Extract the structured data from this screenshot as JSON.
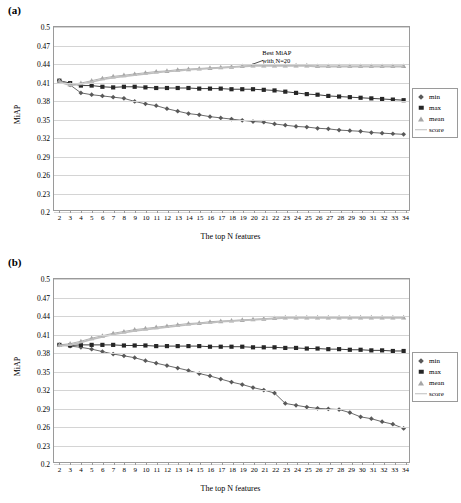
{
  "figure": {
    "panels": [
      {
        "label": "(a)"
      },
      {
        "label": "(b)"
      }
    ]
  },
  "legend": {
    "items": [
      {
        "key": "min",
        "label": "min",
        "marker": "diamond-icon",
        "color": "#595959"
      },
      {
        "key": "max",
        "label": "max",
        "marker": "square-icon",
        "color": "#262626"
      },
      {
        "key": "mean",
        "label": "mean",
        "marker": "triangle-icon",
        "color": "#a6a6a6"
      },
      {
        "key": "score",
        "label": "score",
        "marker": "line-icon",
        "color": "#bfbfbf"
      }
    ]
  },
  "annotation_a": {
    "line1": "Best MiAP",
    "line2": "with N=20"
  },
  "chart_data": [
    {
      "type": "line",
      "id": "panel-a",
      "title": "(a)",
      "xlabel": "The top N features",
      "ylabel": "MiAP",
      "xlim": [
        2,
        34
      ],
      "ylim": [
        0.2,
        0.5
      ],
      "yticks": [
        0.2,
        0.23,
        0.26,
        0.29,
        0.32,
        0.35,
        0.38,
        0.41,
        0.44,
        0.47,
        0.5
      ],
      "ytick_labels": [
        "0.2",
        "0.23",
        "0.26",
        "0.29",
        "0.32",
        "0.35",
        "0.38",
        "0.41",
        "0.44",
        "0.47",
        "0.5"
      ],
      "grid": true,
      "legend_position": "right",
      "categories": [
        2,
        3,
        4,
        5,
        6,
        7,
        8,
        9,
        10,
        11,
        12,
        13,
        14,
        15,
        16,
        17,
        18,
        19,
        20,
        21,
        22,
        23,
        24,
        25,
        26,
        27,
        28,
        29,
        30,
        31,
        32,
        33,
        34
      ],
      "annotations": [
        {
          "text": "Best MiAP with N=20",
          "x": 20,
          "y": 0.44
        }
      ],
      "series": [
        {
          "name": "min",
          "marker": "diamond",
          "color": "#595959",
          "values": [
            0.412,
            0.405,
            0.392,
            0.389,
            0.387,
            0.385,
            0.383,
            0.378,
            0.374,
            0.371,
            0.366,
            0.362,
            0.358,
            0.356,
            0.353,
            0.351,
            0.349,
            0.347,
            0.345,
            0.344,
            0.341,
            0.339,
            0.337,
            0.336,
            0.334,
            0.333,
            0.331,
            0.33,
            0.329,
            0.327,
            0.326,
            0.325,
            0.324
          ]
        },
        {
          "name": "max",
          "marker": "square",
          "color": "#262626",
          "values": [
            0.412,
            0.408,
            0.404,
            0.404,
            0.402,
            0.401,
            0.402,
            0.402,
            0.401,
            0.4,
            0.4,
            0.4,
            0.4,
            0.399,
            0.399,
            0.399,
            0.398,
            0.398,
            0.398,
            0.397,
            0.396,
            0.394,
            0.392,
            0.39,
            0.389,
            0.387,
            0.386,
            0.385,
            0.384,
            0.383,
            0.382,
            0.381,
            0.38
          ]
        },
        {
          "name": "mean",
          "marker": "triangle",
          "color": "#a6a6a6",
          "values": [
            0.412,
            0.406,
            0.408,
            0.412,
            0.416,
            0.419,
            0.421,
            0.423,
            0.425,
            0.427,
            0.428,
            0.43,
            0.431,
            0.432,
            0.433,
            0.434,
            0.435,
            0.436,
            0.437,
            0.437,
            0.437,
            0.437,
            0.437,
            0.437,
            0.436,
            0.436,
            0.436,
            0.436,
            0.436,
            0.436,
            0.436,
            0.436,
            0.436
          ]
        },
        {
          "name": "score",
          "marker": "line",
          "color": "#bfbfbf",
          "values": [
            0.41,
            0.404,
            0.406,
            0.41,
            0.414,
            0.417,
            0.419,
            0.421,
            0.423,
            0.425,
            0.427,
            0.428,
            0.43,
            0.431,
            0.432,
            0.433,
            0.434,
            0.435,
            0.436,
            0.436,
            0.436,
            0.436,
            0.436,
            0.436,
            0.435,
            0.435,
            0.435,
            0.435,
            0.435,
            0.435,
            0.435,
            0.435,
            0.435
          ]
        }
      ]
    },
    {
      "type": "line",
      "id": "panel-b",
      "title": "(b)",
      "xlabel": "The top N features",
      "ylabel": "MiAP",
      "xlim": [
        2,
        34
      ],
      "ylim": [
        0.2,
        0.5
      ],
      "yticks": [
        0.2,
        0.23,
        0.26,
        0.29,
        0.32,
        0.35,
        0.38,
        0.41,
        0.44,
        0.47,
        0.5
      ],
      "ytick_labels": [
        "0.2",
        "0.23",
        "0.26",
        "0.29",
        "0.32",
        "0.35",
        "0.38",
        "0.41",
        "0.44",
        "0.47",
        "0.5"
      ],
      "grid": true,
      "legend_position": "right",
      "categories": [
        2,
        3,
        4,
        5,
        6,
        7,
        8,
        9,
        10,
        11,
        12,
        13,
        14,
        15,
        16,
        17,
        18,
        19,
        20,
        21,
        22,
        23,
        24,
        25,
        26,
        27,
        28,
        29,
        30,
        31,
        32,
        33,
        34
      ],
      "series": [
        {
          "name": "min",
          "marker": "diamond",
          "color": "#595959",
          "values": [
            0.392,
            0.39,
            0.388,
            0.385,
            0.381,
            0.377,
            0.374,
            0.371,
            0.366,
            0.362,
            0.358,
            0.354,
            0.35,
            0.345,
            0.341,
            0.336,
            0.331,
            0.327,
            0.322,
            0.318,
            0.313,
            0.296,
            0.293,
            0.29,
            0.288,
            0.287,
            0.286,
            0.281,
            0.274,
            0.271,
            0.266,
            0.262,
            0.255
          ]
        },
        {
          "name": "max",
          "marker": "square",
          "color": "#262626",
          "values": [
            0.392,
            0.391,
            0.392,
            0.392,
            0.392,
            0.392,
            0.391,
            0.391,
            0.391,
            0.39,
            0.39,
            0.39,
            0.39,
            0.39,
            0.389,
            0.389,
            0.389,
            0.389,
            0.388,
            0.388,
            0.388,
            0.387,
            0.387,
            0.386,
            0.386,
            0.385,
            0.385,
            0.384,
            0.384,
            0.383,
            0.383,
            0.382,
            0.382
          ]
        },
        {
          "name": "mean",
          "marker": "triangle",
          "color": "#a6a6a6",
          "values": [
            0.392,
            0.394,
            0.398,
            0.403,
            0.407,
            0.411,
            0.414,
            0.417,
            0.419,
            0.421,
            0.423,
            0.425,
            0.427,
            0.428,
            0.43,
            0.431,
            0.432,
            0.433,
            0.434,
            0.435,
            0.436,
            0.437,
            0.437,
            0.437,
            0.437,
            0.437,
            0.437,
            0.437,
            0.437,
            0.437,
            0.437,
            0.437,
            0.437
          ]
        },
        {
          "name": "score",
          "marker": "line",
          "color": "#bfbfbf",
          "values": [
            0.39,
            0.392,
            0.396,
            0.401,
            0.405,
            0.409,
            0.412,
            0.415,
            0.417,
            0.419,
            0.421,
            0.423,
            0.425,
            0.427,
            0.428,
            0.43,
            0.431,
            0.432,
            0.433,
            0.434,
            0.435,
            0.436,
            0.436,
            0.436,
            0.436,
            0.436,
            0.436,
            0.436,
            0.436,
            0.436,
            0.436,
            0.436,
            0.436
          ]
        }
      ]
    }
  ]
}
